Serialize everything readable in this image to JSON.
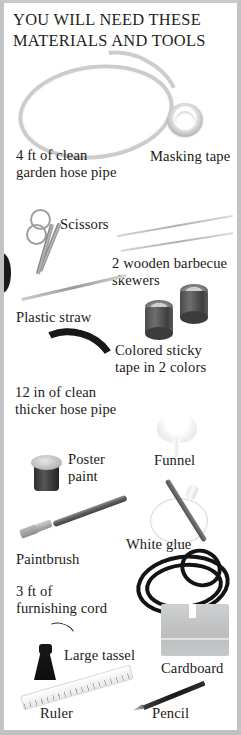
{
  "panel": {
    "title_line1": "YOU WILL NEED THESE",
    "title_line2": "MATERIALS AND TOOLS",
    "background_color": "#ffffff",
    "frame_color": "#c3c3c3",
    "text_color": "#1c1a18"
  },
  "materials": [
    {
      "id": "garden-hose",
      "label_line1": "4 ft of clean",
      "label_line2": "garden hose pipe",
      "icon": "coiled-hose-icon"
    },
    {
      "id": "masking-tape",
      "label_line1": "Masking tape",
      "label_line2": "",
      "icon": "tape-roll-icon"
    },
    {
      "id": "scissors",
      "label_line1": "Scissors",
      "label_line2": "",
      "icon": "scissors-icon"
    },
    {
      "id": "barbecue-skewers",
      "label_line1": "2 wooden barbecue",
      "label_line2": "skewers",
      "icon": "skewer-icon"
    },
    {
      "id": "plastic-straw",
      "label_line1": "Plastic straw",
      "label_line2": "",
      "icon": "straw-icon"
    },
    {
      "id": "colored-sticky-tape",
      "label_line1": "Colored sticky",
      "label_line2": "tape in 2 colors",
      "icon": "tape-cylinder-icon"
    },
    {
      "id": "thicker-hose",
      "label_line1": "12 in of clean",
      "label_line2": "thicker hose pipe",
      "icon": "thick-hose-icon"
    },
    {
      "id": "poster-paint",
      "label_line1": "Poster",
      "label_line2": "paint",
      "icon": "paint-pot-icon"
    },
    {
      "id": "funnel",
      "label_line1": "Funnel",
      "label_line2": "",
      "icon": "funnel-icon"
    },
    {
      "id": "paintbrush",
      "label_line1": "Paintbrush",
      "label_line2": "",
      "icon": "paintbrush-icon"
    },
    {
      "id": "white-glue",
      "label_line1": "White glue",
      "label_line2": "",
      "icon": "glue-bottle-icon"
    },
    {
      "id": "furnishing-cord",
      "label_line1": "3 ft of",
      "label_line2": "furnishing cord",
      "icon": "cord-icon"
    },
    {
      "id": "large-tassel",
      "label_line1": "Large tassel",
      "label_line2": "",
      "icon": "tassel-icon"
    },
    {
      "id": "cardboard",
      "label_line1": "Cardboard",
      "label_line2": "",
      "icon": "cardboard-icon"
    },
    {
      "id": "ruler",
      "label_line1": "Ruler",
      "label_line2": "",
      "icon": "ruler-icon"
    },
    {
      "id": "pencil",
      "label_line1": "Pencil",
      "label_line2": "",
      "icon": "pencil-icon"
    }
  ]
}
